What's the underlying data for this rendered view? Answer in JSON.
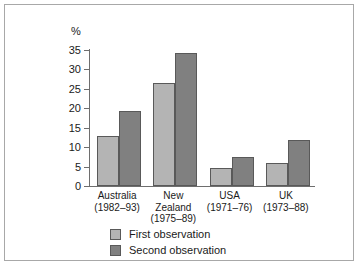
{
  "chart_data": {
    "type": "bar",
    "title": "",
    "subtitle": "",
    "xlabel": "",
    "ylabel": "%",
    "ylim": [
      0,
      35
    ],
    "yticks": [
      0,
      5,
      10,
      15,
      20,
      25,
      30,
      35
    ],
    "ytick_labels": [
      "0",
      "5",
      "10",
      "15",
      "20",
      "25",
      "30",
      "35"
    ],
    "grid": false,
    "legend_position": "bottom-left",
    "categories": [
      "Australia\n(1982–93)",
      "New\nZealand\n(1975–89)",
      "USA\n(1971–76)",
      "UK\n(1973–88)"
    ],
    "series": [
      {
        "name": "First observation",
        "color": "#b4b4b4",
        "values": [
          12.8,
          26.5,
          4.7,
          6.0
        ]
      },
      {
        "name": "Second observation",
        "color": "#808080",
        "values": [
          19.2,
          34.3,
          7.5,
          11.9
        ]
      }
    ]
  },
  "axis": {
    "unit_label": "%"
  },
  "colors": {
    "first_observation": "#b4b4b4",
    "second_observation": "#808080",
    "axis": "#6e6e6e",
    "bar_outline": "#595959",
    "frame": "#a8a8a8",
    "text": "#1a1a1a"
  }
}
